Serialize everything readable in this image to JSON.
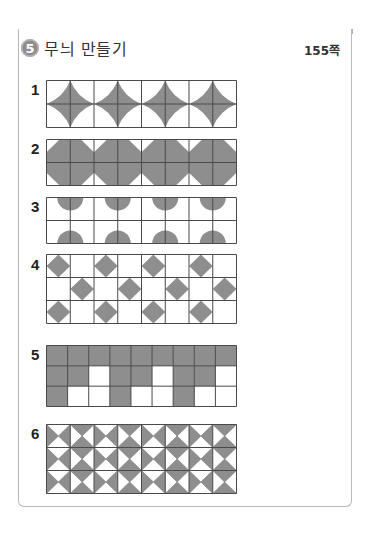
{
  "header": {
    "section_number": "5",
    "title": "무늬 만들기",
    "page_ref": "155쪽"
  },
  "colors": {
    "fill": "#8e8e8e",
    "line": "#4a4a4a",
    "band": "#b3b3b3"
  },
  "problems": [
    {
      "label": "1",
      "cols": 8,
      "rows": 2,
      "pattern": "concave-star-per-2x2-block"
    },
    {
      "label": "2",
      "cols": 8,
      "rows": 2,
      "pattern": "octagon-per-2x2-block"
    },
    {
      "label": "3",
      "cols": 8,
      "rows": 2,
      "pattern": "semicircles-top-and-bottom-per-2-col-block"
    },
    {
      "label": "4",
      "cols": 8,
      "rows": 3,
      "pattern": "diamond-checkerboard",
      "cells": [
        [
          1,
          0,
          1,
          0,
          1,
          0,
          1,
          0
        ],
        [
          0,
          1,
          0,
          1,
          0,
          1,
          0,
          1
        ],
        [
          1,
          0,
          1,
          0,
          1,
          0,
          1,
          0
        ]
      ]
    },
    {
      "label": "5",
      "cols": 9,
      "rows": 3,
      "pattern": "filled-cells",
      "cells": [
        [
          1,
          1,
          1,
          1,
          1,
          1,
          1,
          1,
          1
        ],
        [
          1,
          1,
          0,
          1,
          1,
          0,
          1,
          1,
          0
        ],
        [
          1,
          0,
          0,
          1,
          0,
          0,
          1,
          0,
          0
        ]
      ]
    },
    {
      "label": "6",
      "cols": 8,
      "rows": 3,
      "pattern": "hourglass-alternating-columns"
    }
  ]
}
